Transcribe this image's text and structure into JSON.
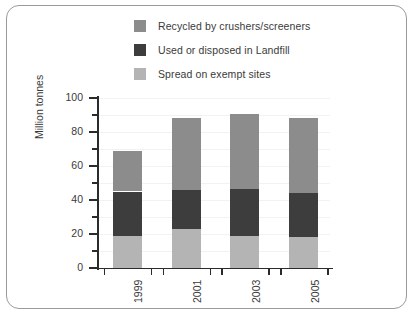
{
  "chart_data": {
    "type": "bar",
    "stacked": true,
    "title": "",
    "xlabel": "",
    "ylabel": "Million tonnes",
    "categories": [
      "1999",
      "2001",
      "2003",
      "2005"
    ],
    "ylim": [
      0,
      100
    ],
    "yticks": [
      0,
      20,
      40,
      60,
      80,
      100
    ],
    "yticks_minor": [
      10,
      30,
      50,
      70,
      90
    ],
    "grid": true,
    "legend_position": "top",
    "series": [
      {
        "name": "Spread on exempt sites",
        "color": "#b4b4b4",
        "values": [
          19,
          23,
          19,
          18
        ]
      },
      {
        "name": "Used or disposed in Landfill",
        "color": "#3d3d3d",
        "values": [
          26,
          23,
          27.5,
          26
        ]
      },
      {
        "name": "Recycled by crushers/screeners",
        "color": "#8c8c8c",
        "values": [
          24,
          42.5,
          44,
          44.5
        ]
      }
    ],
    "totals": [
      69,
      88.5,
      90.5,
      88.5
    ]
  },
  "legend": {
    "items": [
      {
        "label": "Recycled by crushers/screeners",
        "color": "#8c8c8c"
      },
      {
        "label": "Used or disposed in Landfill",
        "color": "#3d3d3d"
      },
      {
        "label": "Spread on exempt sites",
        "color": "#b4b4b4"
      }
    ]
  },
  "axes": {
    "y_title": "Million tonnes",
    "y_labels": [
      "100",
      "80",
      "60",
      "40",
      "20",
      "0"
    ],
    "x_labels": [
      "1999",
      "2001",
      "2003",
      "2005"
    ]
  },
  "colors": {
    "recycled": "#8c8c8c",
    "landfill": "#3d3d3d",
    "spread": "#b4b4b4",
    "axis": "#2b2b2b",
    "grid": "#f3f1f1",
    "border": "#9a9a9a",
    "text": "#3a3a3a"
  }
}
